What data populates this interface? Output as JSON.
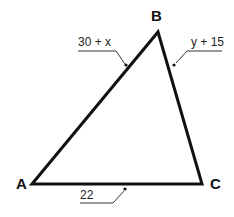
{
  "diagram": {
    "type": "triangle",
    "vertices": [
      {
        "name": "A",
        "x": 32,
        "y": 184
      },
      {
        "name": "B",
        "x": 158,
        "y": 32
      },
      {
        "name": "C",
        "x": 202,
        "y": 184
      }
    ],
    "sides": [
      {
        "id": "AB",
        "label": "30 + x"
      },
      {
        "id": "BC",
        "label": "y + 15"
      },
      {
        "id": "AC",
        "label": "22"
      }
    ],
    "stroke_color": "#111111"
  }
}
